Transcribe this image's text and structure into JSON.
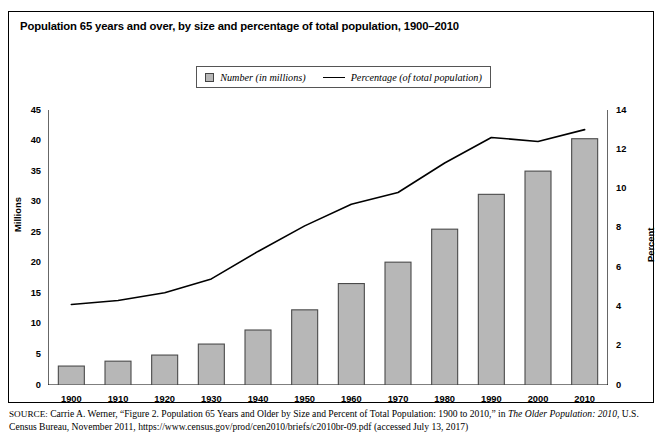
{
  "figure": {
    "title": "Population 65 years and over, by size and percentage of total population, 1900–2010"
  },
  "legend": {
    "items": [
      {
        "label": "Number (in millions)",
        "marker": "square-swatch",
        "color": "#b7b7b7"
      },
      {
        "label": "Percentage (of total population)",
        "marker": "line-swatch",
        "color": "#000000"
      }
    ]
  },
  "axes": {
    "left_label": "Millions",
    "right_label": "Percent",
    "left_ticks": [
      "0",
      "5",
      "10",
      "15",
      "20",
      "25",
      "30",
      "35",
      "40",
      "45"
    ],
    "right_ticks": [
      "0",
      "2",
      "4",
      "6",
      "8",
      "10",
      "12",
      "14"
    ]
  },
  "source": {
    "prefix": "SOURCE:",
    "line1_a": " Carrie A. Werner, “Figure 2. Population 65 Years and Older by Size and Percent of Total Population: 1900 to 2010,” in ",
    "line1_italic": "The Older Population:",
    "line2_italic": "2010",
    "line2_b": ", U.S. Census Bureau, November 2011, https://www.census.gov/prod/cen2010/briefs/c2010br-09.pdf (accessed July 13, 2017)"
  },
  "chart_data": {
    "type": "bar",
    "title": "Population 65 years and over, by size and percentage of total population, 1900–2010",
    "xlabel": "",
    "ylabel": "Millions",
    "y2label": "Percent",
    "ylim": [
      0,
      45
    ],
    "y2lim": [
      0,
      14
    ],
    "grid": false,
    "legend_position": "top-center",
    "categories": [
      "1900",
      "1910",
      "1920",
      "1930",
      "1940",
      "1950",
      "1960",
      "1970",
      "1980",
      "1990",
      "2000",
      "2010"
    ],
    "series": [
      {
        "name": "Number (in millions)",
        "type": "bar",
        "axis": "left",
        "color": "#b7b7b7",
        "values": [
          3.1,
          3.9,
          4.9,
          6.7,
          9.0,
          12.3,
          16.6,
          20.1,
          25.5,
          31.2,
          35.0,
          40.3
        ]
      },
      {
        "name": "Percentage (of total population)",
        "type": "line",
        "axis": "right",
        "color": "#000000",
        "values": [
          4.1,
          4.3,
          4.7,
          5.4,
          6.8,
          8.1,
          9.2,
          9.8,
          11.3,
          12.6,
          12.4,
          13.0
        ]
      }
    ]
  }
}
